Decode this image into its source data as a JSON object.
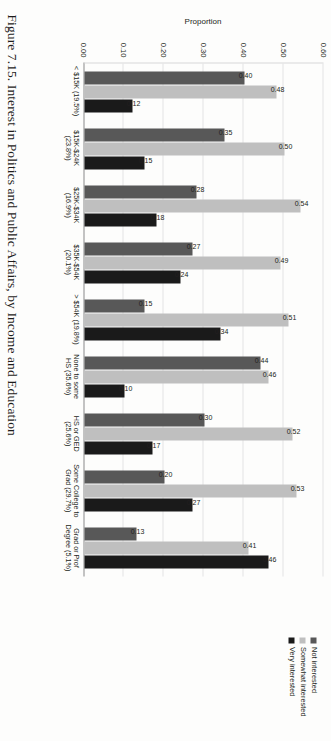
{
  "caption": "Figure 7.15. Interest in Politics and Public Affairs, by Income and Education",
  "legend": {
    "items": [
      {
        "label": "Not interested",
        "color": "#585858",
        "icon": "legend-swatch-icon"
      },
      {
        "label": "Somewhat interested",
        "color": "#bfbfbf",
        "icon": "legend-swatch-icon"
      },
      {
        "label": "Very interested",
        "color": "#1a1a1a",
        "icon": "legend-swatch-icon"
      }
    ]
  },
  "chart_data": {
    "type": "bar",
    "title": "",
    "xlabel": "",
    "ylabel": "Proportion",
    "ylim": [
      0.0,
      0.6
    ],
    "grid": true,
    "legend_position": "top-right",
    "ticks": [
      "0.60",
      "0.50",
      "0.40",
      "0.30",
      "0.20",
      "0.10",
      "0.00"
    ],
    "tick_values": [
      0.6,
      0.5,
      0.4,
      0.3,
      0.2,
      0.1,
      0.0
    ],
    "categories": [
      "< $15K (19.5%)",
      "$15K-$24K (23.8%)",
      "$25K-$34K (16.9%)",
      "$35K-$54K (20.1%)",
      "> $54K (19.8%)",
      "None to some HS (35.6%)",
      "HS or GED (25.6%)",
      "Some College to Grad (29.7%)",
      "Grad or Prof Degree (5.1%)"
    ],
    "series": [
      {
        "name": "Not interested",
        "color": "#585858",
        "values": [
          0.4,
          0.35,
          0.28,
          0.27,
          0.15,
          0.44,
          0.3,
          0.2,
          0.13
        ]
      },
      {
        "name": "Somewhat interested",
        "color": "#bfbfbf",
        "values": [
          0.48,
          0.5,
          0.54,
          0.49,
          0.51,
          0.46,
          0.52,
          0.53,
          0.41
        ]
      },
      {
        "name": "Very interested",
        "color": "#1a1a1a",
        "values": [
          0.12,
          0.15,
          0.18,
          0.24,
          0.34,
          0.1,
          0.17,
          0.27,
          0.46
        ]
      }
    ],
    "data_labels": [
      [
        "0.40",
        "0.35",
        "0.28",
        "0.27",
        "0.15",
        "0.44",
        "0.30",
        "0.20",
        "0.13"
      ],
      [
        "0.48",
        "0.50",
        "0.54",
        "0.49",
        "0.51",
        "0.46",
        "0.52",
        "0.53",
        "0.41"
      ],
      [
        "0.12",
        "0.15",
        "0.18",
        "0.24",
        "0.34",
        "0.10",
        "0.17",
        "0.27",
        "0.46"
      ]
    ]
  }
}
